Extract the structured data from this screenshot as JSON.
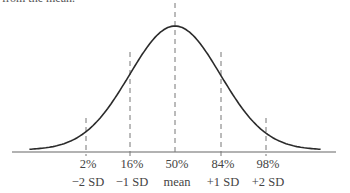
{
  "caption_top": "from the mean.",
  "colors": {
    "curve": "#2b2b2b",
    "axis": "#555555",
    "dash": "#777777",
    "text": "#444444"
  },
  "chart_data": {
    "type": "line",
    "xlabel": "",
    "ylabel": "",
    "grid": false,
    "markers": [
      {
        "x_sd": -2,
        "percentile_label": "2%",
        "sd_label": "−2 SD"
      },
      {
        "x_sd": -1,
        "percentile_label": "16%",
        "sd_label": "−1 SD"
      },
      {
        "x_sd": 0,
        "percentile_label": "50%",
        "sd_label": "mean"
      },
      {
        "x_sd": 1,
        "percentile_label": "84%",
        "sd_label": "+1 SD"
      },
      {
        "x_sd": 2,
        "percentile_label": "98%",
        "sd_label": "+2 SD"
      }
    ],
    "xlim_sd": [
      -3.2,
      3.2
    ]
  },
  "labels": {
    "m0": {
      "pct": "2%",
      "sd": "−2 SD"
    },
    "m1": {
      "pct": "16%",
      "sd": "−1 SD"
    },
    "m2": {
      "pct": "50%",
      "sd": "mean"
    },
    "m3": {
      "pct": "84%",
      "sd": "+1 SD"
    },
    "m4": {
      "pct": "98%",
      "sd": "+2 SD"
    }
  }
}
